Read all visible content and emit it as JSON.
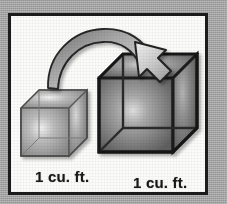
{
  "figure": {
    "panel": {
      "background_color": "#fbfbf9",
      "border_color": "#1c1c1c",
      "outer_background_color": "#a2a2a2"
    },
    "captions": {
      "small_cube_label": "1 cu. ft.",
      "large_cube_label": "1 cu. ft."
    },
    "objects": {
      "small_cube": {
        "name": "small wireframe cube",
        "edge_color": "#585858",
        "face_color": "#8f8f8f"
      },
      "large_cube": {
        "name": "large wireframe cube",
        "edge_color": "#1e1e1e",
        "face_color": "#666666"
      },
      "arrow": {
        "name": "curved transformation arrow",
        "fill_color": "#b4b4b4",
        "outline_color": "#2a2a2a",
        "direction": "left-to-right, curving down into the large cube"
      }
    }
  }
}
